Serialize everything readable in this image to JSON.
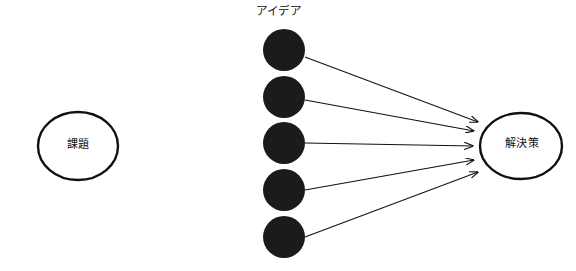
{
  "canvas": {
    "width": 576,
    "height": 271,
    "background_color": "#ffffff"
  },
  "diagram": {
    "type": "convergence-diagram",
    "stroke_color": "#111111",
    "node_fill_color": "#1b1b1b",
    "ellipse_fill_color": "#ffffff"
  },
  "nodes": {
    "issue": {
      "label": "課題",
      "shape": "ellipse",
      "cx": 78,
      "cy": 146,
      "rx": 40,
      "ry": 34,
      "fill": "#ffffff",
      "stroke": "#111111",
      "stroke_width": 2.4
    },
    "solution": {
      "label": "解決策",
      "shape": "ellipse",
      "cx": 521,
      "cy": 146,
      "rx": 41,
      "ry": 33,
      "fill": "#ffffff",
      "stroke": "#111111",
      "stroke_width": 2.4
    },
    "idea_group_label": "アイデア",
    "ideas": [
      {
        "name": "idea-1",
        "cx": 284,
        "cy": 50,
        "r": 21,
        "fill": "#1b1b1b"
      },
      {
        "name": "idea-2",
        "cx": 284,
        "cy": 97,
        "r": 21,
        "fill": "#1b1b1b"
      },
      {
        "name": "idea-3",
        "cx": 284,
        "cy": 143,
        "r": 21,
        "fill": "#1b1b1b"
      },
      {
        "name": "idea-4",
        "cx": 284,
        "cy": 190,
        "r": 21,
        "fill": "#1b1b1b"
      },
      {
        "name": "idea-5",
        "cx": 284,
        "cy": 237,
        "r": 21,
        "fill": "#1b1b1b"
      }
    ]
  },
  "connectors": [
    {
      "name": "arrow-idea-1-to-solution",
      "from": "idea-1",
      "to": "solution",
      "x1": 305,
      "y1": 57,
      "x2": 478,
      "y2": 122
    },
    {
      "name": "arrow-idea-2-to-solution",
      "from": "idea-2",
      "to": "solution",
      "x1": 305,
      "y1": 100,
      "x2": 474,
      "y2": 131
    },
    {
      "name": "arrow-idea-3-to-solution",
      "from": "idea-3",
      "to": "solution",
      "x1": 305,
      "y1": 143,
      "x2": 473,
      "y2": 146
    },
    {
      "name": "arrow-idea-4-to-solution",
      "from": "idea-4",
      "to": "solution",
      "x1": 305,
      "y1": 190,
      "x2": 474,
      "y2": 160
    },
    {
      "name": "arrow-idea-5-to-solution",
      "from": "idea-5",
      "to": "solution",
      "x1": 305,
      "y1": 237,
      "x2": 478,
      "y2": 172
    }
  ]
}
